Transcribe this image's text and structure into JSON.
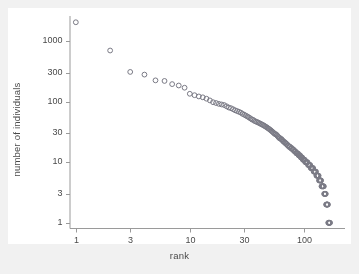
{
  "figure": {
    "background_color": "#f1f1f1",
    "plot_background_color": "#ffffff",
    "axis_color": "#9a9a9a",
    "marker_color": "#7a7a85",
    "text_color": "#4a4a4a"
  },
  "chart_data": {
    "type": "scatter",
    "title": "",
    "subtitle": "",
    "xlabel": "rank",
    "ylabel": "number of individuals",
    "xscale": "log",
    "yscale": "log",
    "grid": false,
    "legend": null,
    "xlim": [
      0.88,
      230
    ],
    "ylim": [
      0.82,
      2600
    ],
    "xticks": [
      1,
      3,
      10,
      30,
      100
    ],
    "xtick_labels": [
      "1",
      "3",
      "10",
      "30",
      "100"
    ],
    "yticks": [
      1,
      3,
      10,
      30,
      100,
      300,
      1000
    ],
    "ytick_labels": [
      "1",
      "3",
      "10",
      "30",
      "100",
      "300",
      "1000"
    ],
    "marker": "open-circle",
    "marker_size": 3.6,
    "x": [
      1,
      2,
      3,
      4,
      5,
      6,
      7,
      8,
      9,
      10,
      11,
      12,
      13,
      14,
      15,
      16,
      17,
      18,
      19,
      20,
      21,
      22,
      23,
      24,
      25,
      26,
      27,
      28,
      29,
      30,
      31,
      32,
      33,
      34,
      35,
      36,
      37,
      38,
      39,
      40,
      41,
      42,
      43,
      44,
      45,
      46,
      47,
      48,
      49,
      50,
      51,
      52,
      53,
      54,
      55,
      56,
      57,
      58,
      59,
      60,
      61,
      62,
      63,
      64,
      65,
      66,
      67,
      68,
      69,
      70,
      71,
      72,
      73,
      74,
      75,
      76,
      77,
      78,
      79,
      80,
      81,
      82,
      83,
      84,
      85,
      86,
      87,
      88,
      89,
      90,
      91,
      92,
      93,
      94,
      95,
      96,
      97,
      98,
      99,
      100,
      101,
      102,
      103,
      104,
      105,
      106,
      107,
      108,
      109,
      110,
      111,
      112,
      113,
      114,
      115,
      116,
      117,
      118,
      119,
      120,
      121,
      122,
      123,
      124,
      125,
      126,
      127,
      128,
      129,
      130,
      131,
      132,
      133,
      134,
      135,
      136,
      137,
      138,
      139,
      140,
      141,
      142,
      143,
      144,
      145,
      146,
      147,
      148,
      149,
      150,
      151,
      152,
      153,
      154,
      155,
      156,
      157,
      158,
      159,
      160,
      161,
      162,
      163,
      164,
      165,
      166,
      167,
      168,
      169,
      170,
      171,
      172,
      173,
      174,
      175,
      176,
      177,
      178,
      179,
      180
    ],
    "y": [
      2050,
      700,
      310,
      280,
      225,
      220,
      195,
      185,
      170,
      135,
      128,
      122,
      118,
      112,
      105,
      98,
      95,
      92,
      90,
      88,
      84,
      80,
      78,
      75,
      72,
      70,
      68,
      66,
      63,
      61,
      59,
      57,
      55,
      53,
      51,
      50,
      48,
      47,
      46,
      45,
      44,
      43,
      42,
      41,
      40,
      39,
      38,
      37,
      36,
      35,
      34,
      33,
      32,
      31,
      30,
      29,
      29,
      28,
      27,
      26,
      25,
      25,
      24,
      24,
      23,
      22,
      22,
      21,
      21,
      20,
      20,
      19,
      19,
      18,
      18,
      18,
      17,
      17,
      17,
      16,
      16,
      16,
      15,
      15,
      15,
      14,
      14,
      14,
      14,
      13,
      13,
      13,
      13,
      12,
      12,
      12,
      12,
      11,
      11,
      11,
      11,
      11,
      10,
      10,
      10,
      10,
      10,
      10,
      9,
      9,
      9,
      9,
      9,
      9,
      8,
      8,
      8,
      8,
      8,
      8,
      8,
      7,
      7,
      7,
      7,
      7,
      7,
      7,
      6,
      6,
      6,
      6,
      6,
      6,
      6,
      5,
      5,
      5,
      5,
      5,
      5,
      5,
      4,
      4,
      4,
      4,
      4,
      4,
      4,
      4,
      3,
      3,
      3,
      3,
      3,
      3,
      2,
      2,
      2,
      2,
      2,
      2,
      2,
      1,
      1,
      1,
      1,
      1,
      1,
      1
    ]
  }
}
